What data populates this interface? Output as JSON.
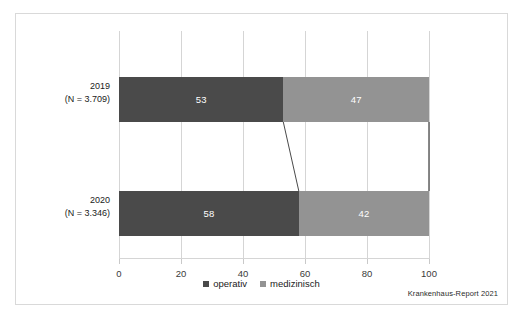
{
  "figure": {
    "source_note": "Krankenhaus-Report 2021",
    "frame_color": "#d9d9d9"
  },
  "chart_data": {
    "type": "bar",
    "orientation": "horizontal",
    "stacked": true,
    "normalized_percent": true,
    "title": "",
    "xlabel": "",
    "ylabel": "",
    "xlim": [
      0,
      100
    ],
    "xticks": [
      0,
      20,
      40,
      60,
      80,
      100
    ],
    "xticklabels": [
      "0",
      "20",
      "40",
      "60",
      "80",
      "100"
    ],
    "grid": true,
    "grid_axis": "x",
    "legend_position": "bottom-center",
    "categories": [
      "2019\n(N = 3.709)",
      "2020\n(N = 3.346)"
    ],
    "category_labels": [
      {
        "year": "2019",
        "n": "(N = 3.709)"
      },
      {
        "year": "2020",
        "n": "(N = 3.346)"
      }
    ],
    "series": [
      {
        "name": "operativ",
        "color": "#4a4a4a",
        "values": [
          53,
          58
        ]
      },
      {
        "name": "medizinisch",
        "color": "#939393",
        "values": [
          47,
          42
        ]
      }
    ],
    "bar_labels": [
      [
        "53",
        "47"
      ],
      [
        "58",
        "42"
      ]
    ],
    "connectors": [
      {
        "from_category": "2019",
        "to_category": "2020",
        "at_value": 53,
        "to_value": 58,
        "color": "#4a4a4a"
      },
      {
        "from_category": "2019",
        "to_category": "2020",
        "at_value": 100,
        "to_value": 100,
        "color": "#6b6b6b"
      }
    ]
  },
  "legend": {
    "items": [
      {
        "label": "operativ",
        "color": "#4a4a4a"
      },
      {
        "label": "medizinisch",
        "color": "#939393"
      }
    ]
  }
}
